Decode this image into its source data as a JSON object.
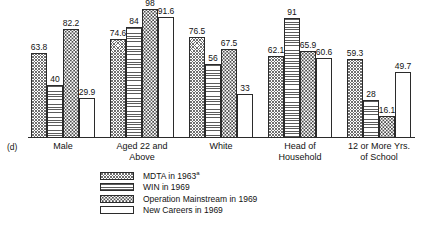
{
  "panel_label": "(d)",
  "legend": {
    "items": [
      {
        "label": "MDTA in 1963",
        "superscript": "a",
        "pattern": "crosshatch"
      },
      {
        "label": "WIN in 1969",
        "superscript": "",
        "pattern": "hlines"
      },
      {
        "label": "Operation Mainstream in 1969",
        "superscript": "",
        "pattern": "dots"
      },
      {
        "label": "New Careers in 1969",
        "superscript": "",
        "pattern": "blank"
      }
    ]
  },
  "chart_data": {
    "type": "bar",
    "title": "",
    "subtitle": "",
    "xlabel": "",
    "ylabel": "",
    "ylim": [
      0,
      100
    ],
    "grid": false,
    "legend_position": "bottom-left",
    "value_labels": true,
    "categories": [
      "Male",
      "Aged 22 and Above",
      "White",
      "Head of Household",
      "12 or More Yrs. of School"
    ],
    "category_lines": [
      [
        "Male"
      ],
      [
        "Aged 22 and",
        "Above"
      ],
      [
        "White"
      ],
      [
        "Head of",
        "Household"
      ],
      [
        "12 or More Yrs.",
        "of School"
      ]
    ],
    "series": [
      {
        "name": "MDTA in 1963a",
        "pattern": "crosshatch",
        "values": [
          63.8,
          74.6,
          76.5,
          62.1,
          59.3
        ],
        "labels": [
          "63.8",
          "74.6",
          "76.5",
          "62.1",
          "59.3"
        ]
      },
      {
        "name": "WIN in 1969",
        "pattern": "hlines",
        "values": [
          40,
          84,
          56,
          91,
          28
        ],
        "labels": [
          "40",
          "84",
          "56",
          "91",
          "28"
        ]
      },
      {
        "name": "Operation Mainstream in 1969",
        "pattern": "dots",
        "values": [
          82.2,
          98,
          67.5,
          65.9,
          16.1
        ],
        "labels": [
          "82.2",
          "98",
          "67.5",
          "65.9",
          "16.1"
        ]
      },
      {
        "name": "New Careers in 1969",
        "pattern": "blank",
        "values": [
          29.9,
          91.6,
          33,
          60.6,
          49.7
        ],
        "labels": [
          "29.9",
          "91.6",
          "33",
          "60.6",
          "49.7"
        ]
      }
    ]
  }
}
